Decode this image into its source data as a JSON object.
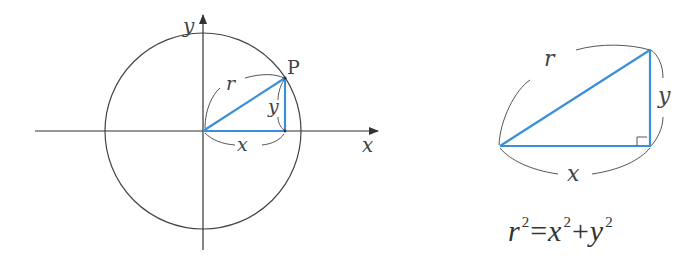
{
  "colors": {
    "triangle": "#3a8fd8",
    "axis": "#333333",
    "circle": "#444444",
    "brace": "#555555",
    "text": "#333333"
  },
  "left_diagram": {
    "x_axis_label": "x",
    "y_axis_label": "y",
    "point_label": "P",
    "hypotenuse_label": "r",
    "horizontal_leg_label": "x",
    "vertical_leg_label": "y"
  },
  "right_diagram": {
    "hypotenuse_label": "r",
    "horizontal_leg_label": "x",
    "vertical_leg_label": "y",
    "right_angle_marker": true
  },
  "formula": {
    "lhs_var": "r",
    "lhs_exp": "2",
    "equals": "=",
    "term1_var": "x",
    "term1_exp": "2",
    "plus": "+",
    "term2_var": "y",
    "term2_exp": "2"
  }
}
